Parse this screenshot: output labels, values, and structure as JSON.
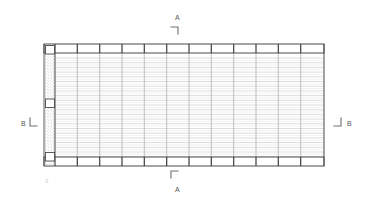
{
  "drawing": {
    "type": "framing-plan",
    "title": "Structural Framing Plan",
    "background_color": "#ffffff",
    "line_color_heavy": "#4a4a4a",
    "line_color_medium": "#8c8c8c",
    "line_color_light": "#d2d2d2",
    "hatch_color": "#b9b9b9",
    "label_color": "#555555",
    "faint_label_color": "#cdcdcd"
  },
  "section_markers": {
    "a_top": {
      "label": "A",
      "tick": "corner-tick-down-left"
    },
    "a_bottom": {
      "label": "A",
      "tick": "corner-tick-up-left"
    },
    "b_left": {
      "label": "B",
      "tick": "corner-tick-right"
    },
    "b_right": {
      "label": "B",
      "tick": "corner-tick-left"
    }
  },
  "annotations": {
    "plan_tag": "3"
  },
  "geometry": {
    "plan_left": 44,
    "plan_right": 324,
    "plan_top": 44,
    "plan_bottom": 166,
    "top_band_height": 9,
    "bottom_band_height": 9,
    "bay_count": 12,
    "joist_count": 22,
    "wall_left": 45,
    "wall_width": 9,
    "wall_blocks_y": [
      46,
      99,
      153
    ],
    "wall_block_size": 8
  }
}
